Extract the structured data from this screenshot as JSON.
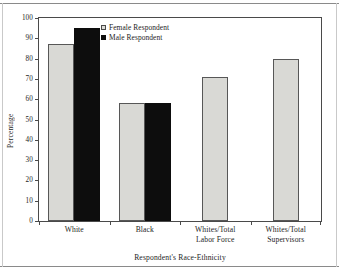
{
  "figure": {
    "kind": "scanned-bar-chart"
  },
  "axes": {
    "y_title": "Percentage",
    "x_title": "Respondent's Race-Ethnicity",
    "y_ticks": [
      "100",
      "90",
      "80",
      "70",
      "60",
      "50",
      "40",
      "30",
      "20",
      "10",
      "0"
    ]
  },
  "legend": {
    "items": [
      {
        "label": "Female Respondent",
        "swatch": "light-gray-square",
        "color": "#d9d9d5"
      },
      {
        "label": "Male Respondent",
        "swatch": "black-square",
        "color": "#0d0d0d"
      }
    ]
  },
  "categories": [
    {
      "line1": "White",
      "line2": ""
    },
    {
      "line1": "Black",
      "line2": ""
    },
    {
      "line1": "Whites/Total",
      "line2": "Labor Force"
    },
    {
      "line1": "Whites/Total",
      "line2": "Supervisors"
    }
  ],
  "chart_data": {
    "type": "bar",
    "title": "",
    "xlabel": "Respondent's Race-Ethnicity",
    "ylabel": "Percentage",
    "ylim": [
      0,
      100
    ],
    "ytick_step": 10,
    "grid": false,
    "legend_position": "upper-center-inside",
    "categories": [
      "White",
      "Black",
      "Whites/Total Labor Force",
      "Whites/Total Supervisors"
    ],
    "series": [
      {
        "name": "Female Respondent",
        "color": "#d9d9d5",
        "values": [
          87,
          58,
          71,
          80
        ]
      },
      {
        "name": "Male Respondent",
        "color": "#0d0d0d",
        "values": [
          95,
          58,
          null,
          null
        ]
      }
    ]
  }
}
